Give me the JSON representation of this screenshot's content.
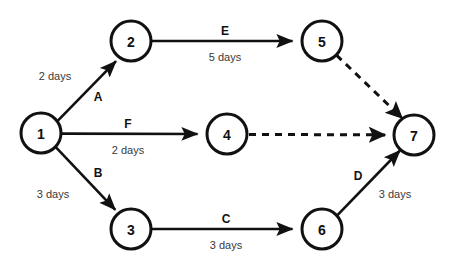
{
  "diagram": {
    "type": "activity-on-arrow-network",
    "background_color": "#ffffff",
    "stroke_color": "#111111",
    "duration_text_color": "#3a3a3a",
    "node_radius": 20,
    "nodes": [
      {
        "id": "1",
        "label": "1",
        "x": 41,
        "y": 133
      },
      {
        "id": "2",
        "label": "2",
        "x": 131,
        "y": 41
      },
      {
        "id": "3",
        "label": "3",
        "x": 131,
        "y": 229
      },
      {
        "id": "4",
        "label": "4",
        "x": 227,
        "y": 134
      },
      {
        "id": "5",
        "label": "5",
        "x": 322,
        "y": 41
      },
      {
        "id": "6",
        "label": "6",
        "x": 322,
        "y": 229
      },
      {
        "id": "7",
        "label": "7",
        "x": 414,
        "y": 135
      }
    ],
    "edges": [
      {
        "id": "A",
        "name": "A",
        "duration": "2 days",
        "from": "1",
        "to": "2",
        "style": "solid",
        "arrow": true,
        "name_x": 98,
        "name_y": 97,
        "duration_x": 55,
        "duration_y": 76
      },
      {
        "id": "B",
        "name": "B",
        "duration": "3 days",
        "from": "1",
        "to": "3",
        "style": "solid",
        "arrow": true,
        "name_x": 98,
        "name_y": 173,
        "duration_x": 53,
        "duration_y": 194
      },
      {
        "id": "F",
        "name": "F",
        "duration": "2 days",
        "from": "1",
        "to": "4",
        "style": "solid",
        "arrow": true,
        "name_x": 128,
        "name_y": 124,
        "duration_x": 128,
        "duration_y": 150
      },
      {
        "id": "E",
        "name": "E",
        "duration": "5 days",
        "from": "2",
        "to": "5",
        "style": "solid",
        "arrow": true,
        "name_x": 225,
        "name_y": 31,
        "duration_x": 225,
        "duration_y": 57
      },
      {
        "id": "C",
        "name": "C",
        "duration": "3 days",
        "from": "3",
        "to": "6",
        "style": "solid",
        "arrow": true,
        "name_x": 226,
        "name_y": 219,
        "duration_x": 226,
        "duration_y": 245
      },
      {
        "id": "D",
        "name": "D",
        "duration": "3 days",
        "from": "6",
        "to": "7",
        "style": "solid",
        "arrow": true,
        "name_x": 358,
        "name_y": 176,
        "duration_x": 395,
        "duration_y": 194
      },
      {
        "id": "dummy-5-7",
        "name": "",
        "duration": "",
        "from": "5",
        "to": "7",
        "style": "dashed",
        "arrow": true
      },
      {
        "id": "dummy-4-7",
        "name": "",
        "duration": "",
        "from": "4",
        "to": "7",
        "style": "dashed",
        "arrow": true
      }
    ]
  }
}
